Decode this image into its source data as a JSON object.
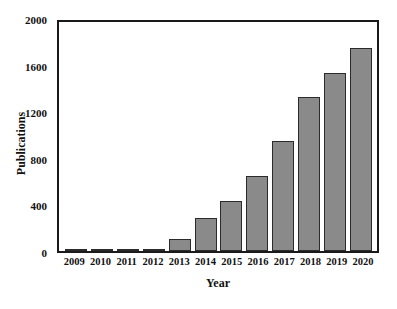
{
  "chart_data": {
    "type": "bar",
    "title": "",
    "xlabel": "Year",
    "ylabel": "Publications",
    "categories": [
      "2009",
      "2010",
      "2011",
      "2012",
      "2013",
      "2014",
      "2015",
      "2016",
      "2017",
      "2018",
      "2019",
      "2020"
    ],
    "values": [
      2,
      3,
      20,
      12,
      105,
      285,
      435,
      650,
      955,
      1335,
      1545,
      1755
    ],
    "ylim": [
      0,
      2000
    ],
    "yticks": [
      0,
      400,
      800,
      1200,
      1600,
      2000
    ],
    "ytick_labels": [
      "0",
      "400",
      "800",
      "1200",
      "1600",
      "2000"
    ],
    "grid": false,
    "legend": "none",
    "bar_color": "#8a8a8a",
    "bar_edge_color": "#2b2b2b",
    "axis_color": "#1a1a1a",
    "background": "#ffffff"
  }
}
